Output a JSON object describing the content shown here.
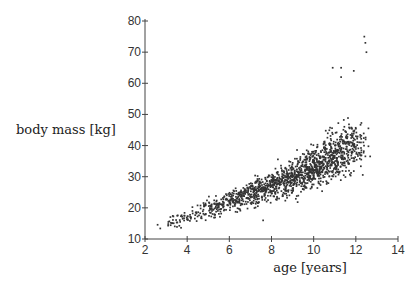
{
  "chart_data": {
    "type": "scatter",
    "title": "",
    "xlabel": "age [years]",
    "ylabel": "body mass [kg]",
    "xlim": [
      2,
      14
    ],
    "ylim": [
      10,
      80
    ],
    "xticks": [
      2,
      4,
      6,
      8,
      10,
      12,
      14
    ],
    "yticks": [
      10,
      20,
      30,
      40,
      50,
      60,
      70,
      80
    ],
    "grid": false,
    "legend": null,
    "series": [
      {
        "name": "individuals",
        "description": "Dense point cloud of ~1500 observations from age 2 to ~12.7 years; mass rises from ~12 kg at age 2 to ~40 kg at age 12 with spread widening with age.",
        "trend": [
          {
            "x": 2,
            "y_mean": 13,
            "y_min": 10,
            "y_max": 18
          },
          {
            "x": 4,
            "y_mean": 17,
            "y_min": 12,
            "y_max": 23
          },
          {
            "x": 6,
            "y_mean": 22,
            "y_min": 16,
            "y_max": 31
          },
          {
            "x": 8,
            "y_mean": 27,
            "y_min": 18,
            "y_max": 38
          },
          {
            "x": 10,
            "y_mean": 33,
            "y_min": 22,
            "y_max": 48
          },
          {
            "x": 11,
            "y_mean": 37,
            "y_min": 24,
            "y_max": 65
          },
          {
            "x": 12,
            "y_mean": 40,
            "y_min": 26,
            "y_max": 65
          },
          {
            "x": 12.7,
            "y_mean": 43,
            "y_min": 28,
            "y_max": 75
          }
        ],
        "outliers": [
          {
            "x": 12.4,
            "y": 75
          },
          {
            "x": 12.45,
            "y": 73
          },
          {
            "x": 12.5,
            "y": 70
          },
          {
            "x": 10.9,
            "y": 65
          },
          {
            "x": 11.3,
            "y": 65
          },
          {
            "x": 11.9,
            "y": 64
          },
          {
            "x": 11.3,
            "y": 62
          },
          {
            "x": 7.6,
            "y": 16
          }
        ],
        "n_points": 1500,
        "x_range": [
          2,
          12.7
        ]
      }
    ]
  }
}
